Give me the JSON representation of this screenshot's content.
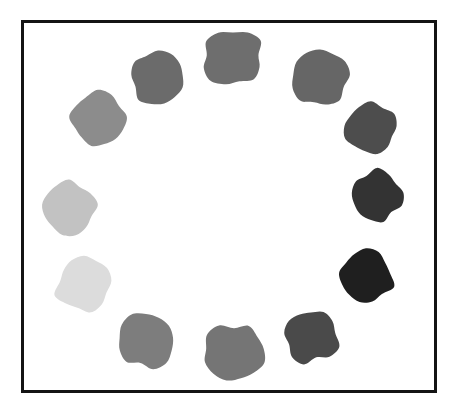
{
  "figure": {
    "title": "",
    "background_color": "#ffffff",
    "frame": {
      "name": "plot-frame",
      "border_color": "#141414",
      "border_width_px": 3,
      "fill_color": "#ffffff",
      "x": 21,
      "y": 20,
      "width": 416,
      "height": 373
    }
  },
  "chart_data": {
    "type": "scatter",
    "title": "",
    "subtitle": "",
    "xlabel": "",
    "ylabel": "",
    "xlim": [
      0,
      462
    ],
    "ylim": [
      0,
      412
    ],
    "grid": false,
    "legend": null,
    "annotations": [],
    "marker_shape": "irregular-blob",
    "point_count": 12,
    "ring_center": [
      229,
      206
    ],
    "ring_radius": 140,
    "categories": [
      "blob-1",
      "blob-2",
      "blob-3",
      "blob-4",
      "blob-5",
      "blob-6",
      "blob-7",
      "blob-8",
      "blob-9",
      "blob-10",
      "blob-11",
      "blob-12"
    ],
    "series": [
      {
        "name": "ring-blobs",
        "values": [
          {
            "id": "blob-1",
            "label": "top",
            "angle_deg": 90,
            "cx": 233,
            "cy": 58,
            "rx": 30,
            "ry": 27,
            "color": "#6e6e6e",
            "gray_level": 110
          },
          {
            "id": "blob-2",
            "label": "upper-right",
            "angle_deg": 60,
            "cx": 320,
            "cy": 78,
            "rx": 28,
            "ry": 28,
            "color": "#666666",
            "gray_level": 102
          },
          {
            "id": "blob-3",
            "label": "right-upper",
            "angle_deg": 30,
            "cx": 371,
            "cy": 129,
            "rx": 26,
            "ry": 25,
            "color": "#4d4d4d",
            "gray_level": 77
          },
          {
            "id": "blob-4",
            "label": "right",
            "angle_deg": 0,
            "cx": 377,
            "cy": 196,
            "rx": 26,
            "ry": 26,
            "color": "#333333",
            "gray_level": 51
          },
          {
            "id": "blob-5",
            "label": "right-lower",
            "angle_deg": -30,
            "cx": 366,
            "cy": 276,
            "rx": 26,
            "ry": 26,
            "color": "#1f1f1f",
            "gray_level": 31
          },
          {
            "id": "blob-6",
            "label": "lower-right",
            "angle_deg": -60,
            "cx": 311,
            "cy": 336,
            "rx": 26,
            "ry": 26,
            "color": "#4a4a4a",
            "gray_level": 74
          },
          {
            "id": "blob-7",
            "label": "bottom",
            "angle_deg": -90,
            "cx": 234,
            "cy": 352,
            "rx": 30,
            "ry": 28,
            "color": "#757575",
            "gray_level": 117
          },
          {
            "id": "blob-8",
            "label": "lower-left",
            "angle_deg": -120,
            "cx": 146,
            "cy": 341,
            "rx": 28,
            "ry": 27,
            "color": "#7d7d7d",
            "gray_level": 125
          },
          {
            "id": "blob-9",
            "label": "left-lower",
            "angle_deg": -150,
            "cx": 84,
            "cy": 284,
            "rx": 27,
            "ry": 27,
            "color": "#dcdcdc",
            "gray_level": 220
          },
          {
            "id": "blob-10",
            "label": "left",
            "angle_deg": 180,
            "cx": 69,
            "cy": 208,
            "rx": 27,
            "ry": 27,
            "color": "#c2c2c2",
            "gray_level": 194
          },
          {
            "id": "blob-11",
            "label": "left-upper",
            "angle_deg": 150,
            "cx": 98,
            "cy": 120,
            "rx": 27,
            "ry": 26,
            "color": "#8c8c8c",
            "gray_level": 140
          },
          {
            "id": "blob-12",
            "label": "upper-left",
            "angle_deg": 120,
            "cx": 158,
            "cy": 78,
            "rx": 27,
            "ry": 27,
            "color": "#6b6b6b",
            "gray_level": 107
          }
        ]
      }
    ]
  }
}
